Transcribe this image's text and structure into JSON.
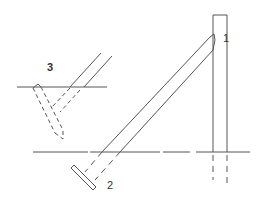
{
  "diagram": {
    "labels": {
      "one": "1",
      "two": "2",
      "three": "3"
    },
    "colors": {
      "line": "#555555",
      "background": "#ffffff"
    }
  }
}
